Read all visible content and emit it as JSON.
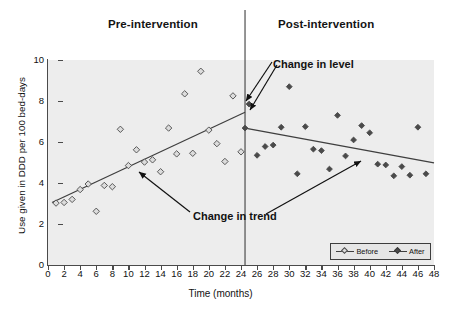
{
  "figure": {
    "pre_label": "Pre-intervention",
    "post_label": "Post-intervention",
    "annotation_level": "Change in level",
    "annotation_trend": "Change in trend"
  },
  "legend": {
    "position": "bottom-right",
    "items": [
      {
        "label": "Before",
        "marker": "open-diamond"
      },
      {
        "label": "After",
        "marker": "filled-diamond"
      }
    ]
  },
  "colors": {
    "plot_background": "#ededed",
    "page_background": "#ffffff",
    "axis": "#4a4a4a",
    "trend_line": "#3f3f3f",
    "intervention_line": "#3f3f3f",
    "marker_before_fill": "#dcdcdc",
    "marker_before_edge": "#4a4a4a",
    "marker_after_fill": "#4a4a4a",
    "text": "#121212"
  },
  "chart_data": {
    "type": "scatter",
    "title": "",
    "subtitle": "",
    "xlabel": "Time (months)",
    "ylabel": "Use given in DDD per 100 bed-days",
    "xlim": [
      0,
      48
    ],
    "ylim": [
      0,
      10
    ],
    "xticks": [
      0,
      2,
      4,
      6,
      8,
      10,
      12,
      14,
      16,
      18,
      20,
      22,
      24,
      26,
      28,
      30,
      32,
      34,
      36,
      38,
      40,
      42,
      44,
      46,
      48
    ],
    "yticks": [
      0,
      2,
      4,
      6,
      8,
      10
    ],
    "grid": false,
    "legend_position": "lower right",
    "intervention": {
      "x": 24.5,
      "label": "intervention-line",
      "level_before": 7.45,
      "level_after": 6.68,
      "level_change": -0.77
    },
    "series": [
      {
        "name": "Before",
        "marker": "open-diamond",
        "points": [
          {
            "x": 1,
            "y": 3.02
          },
          {
            "x": 2,
            "y": 3.05
          },
          {
            "x": 3,
            "y": 3.2
          },
          {
            "x": 4,
            "y": 3.68
          },
          {
            "x": 5,
            "y": 3.95
          },
          {
            "x": 6,
            "y": 2.62
          },
          {
            "x": 7,
            "y": 3.88
          },
          {
            "x": 8,
            "y": 3.82
          },
          {
            "x": 9,
            "y": 6.62
          },
          {
            "x": 10,
            "y": 4.85
          },
          {
            "x": 11,
            "y": 5.62
          },
          {
            "x": 12,
            "y": 5.02
          },
          {
            "x": 13,
            "y": 5.13
          },
          {
            "x": 14,
            "y": 4.55
          },
          {
            "x": 15,
            "y": 6.68
          },
          {
            "x": 16,
            "y": 5.42
          },
          {
            "x": 17,
            "y": 8.35
          },
          {
            "x": 18,
            "y": 5.45
          },
          {
            "x": 19,
            "y": 9.45
          },
          {
            "x": 20,
            "y": 6.58
          },
          {
            "x": 21,
            "y": 5.92
          },
          {
            "x": 22,
            "y": 5.05
          },
          {
            "x": 23,
            "y": 8.25
          },
          {
            "x": 24,
            "y": 5.52
          }
        ]
      },
      {
        "name": "After",
        "marker": "filled-diamond",
        "points": [
          {
            "x": 25,
            "y": 7.85
          },
          {
            "x": 26,
            "y": 5.35
          },
          {
            "x": 27,
            "y": 5.78
          },
          {
            "x": 28,
            "y": 5.85
          },
          {
            "x": 29,
            "y": 6.72
          },
          {
            "x": 30,
            "y": 8.7
          },
          {
            "x": 31,
            "y": 4.45
          },
          {
            "x": 32,
            "y": 6.75
          },
          {
            "x": 33,
            "y": 5.65
          },
          {
            "x": 34,
            "y": 5.58
          },
          {
            "x": 35,
            "y": 4.68
          },
          {
            "x": 36,
            "y": 7.3
          },
          {
            "x": 37,
            "y": 5.32
          },
          {
            "x": 38,
            "y": 6.1
          },
          {
            "x": 39,
            "y": 6.8
          },
          {
            "x": 40,
            "y": 6.45
          },
          {
            "x": 41,
            "y": 4.92
          },
          {
            "x": 42,
            "y": 4.88
          },
          {
            "x": 43,
            "y": 4.35
          },
          {
            "x": 44,
            "y": 4.8
          },
          {
            "x": 45,
            "y": 4.38
          },
          {
            "x": 46,
            "y": 6.72
          },
          {
            "x": 47,
            "y": 4.45
          }
        ]
      }
    ],
    "trend_lines": [
      {
        "name": "pre-intervention-trend",
        "x0": 0.5,
        "y0": 3.05,
        "x1": 24.5,
        "y1": 7.45,
        "slope": 0.183
      },
      {
        "name": "post-intervention-trend",
        "x0": 24.5,
        "y0": 6.68,
        "x1": 48.0,
        "y1": 4.98,
        "slope": -0.072
      }
    ],
    "annotations": [
      {
        "text": "Change in level",
        "x": 29.5,
        "y": 9.1
      },
      {
        "text": "Change in trend",
        "x": 19.0,
        "y": 2.55
      }
    ]
  }
}
